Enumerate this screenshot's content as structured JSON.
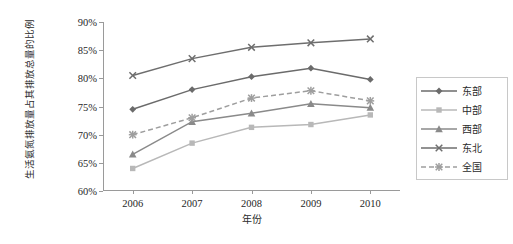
{
  "chart_data": {
    "type": "line",
    "title": "",
    "xlabel": "年份",
    "ylabel": "生活氨氮排放量占其排放总量的比例",
    "categories": [
      "2006",
      "2007",
      "2008",
      "2009",
      "2010"
    ],
    "x": [
      2006,
      2007,
      2008,
      2009,
      2010
    ],
    "ylim": [
      60,
      90
    ],
    "ytick_labels": [
      "60%",
      "65%",
      "70%",
      "75%",
      "80%",
      "85%",
      "90%"
    ],
    "ytick_values": [
      60,
      65,
      70,
      75,
      80,
      85,
      90
    ],
    "grid": false,
    "legend_position": "right",
    "value_unit": "%",
    "series": [
      {
        "name": "东部",
        "marker": "diamond",
        "dash": false,
        "color": "#6b6b6b",
        "values": [
          74.5,
          78.0,
          80.3,
          81.8,
          79.8
        ]
      },
      {
        "name": "中部",
        "marker": "square",
        "dash": false,
        "color": "#b8b8b8",
        "values": [
          64.0,
          68.5,
          71.3,
          71.8,
          73.5
        ]
      },
      {
        "name": "西部",
        "marker": "triangle",
        "dash": false,
        "color": "#8a8a8a",
        "values": [
          66.5,
          72.3,
          73.8,
          75.5,
          74.8
        ]
      },
      {
        "name": "东北",
        "marker": "cross",
        "dash": false,
        "color": "#6e6e6e",
        "values": [
          80.5,
          83.5,
          85.5,
          86.3,
          87.0
        ]
      },
      {
        "name": "全国",
        "marker": "star",
        "dash": true,
        "color": "#9e9e9e",
        "values": [
          70.0,
          73.0,
          76.5,
          77.8,
          76.0
        ]
      }
    ]
  },
  "legend": {
    "items": [
      {
        "label": "东部"
      },
      {
        "label": "中部"
      },
      {
        "label": "西部"
      },
      {
        "label": "东北"
      },
      {
        "label": "全国"
      }
    ]
  }
}
